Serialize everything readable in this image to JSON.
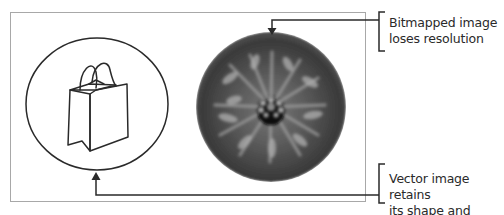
{
  "diagram": {
    "callouts": {
      "bitmap": {
        "line1": "Bitmapped image",
        "line2": "loses resolution"
      },
      "vector": {
        "line1": "Vector image retains",
        "line2": "its shape and clarity"
      }
    },
    "icons": {
      "vector_image": "shopping-bag-icon",
      "bitmap_image": "blurred-flower-photo"
    },
    "colors": {
      "line": "#2a2a2a",
      "frame": "#a8a8a8",
      "bitmap_dark": "#2e2e2e",
      "bitmap_mid": "#5a5a5a",
      "bitmap_light": "#a0a0a0"
    }
  }
}
